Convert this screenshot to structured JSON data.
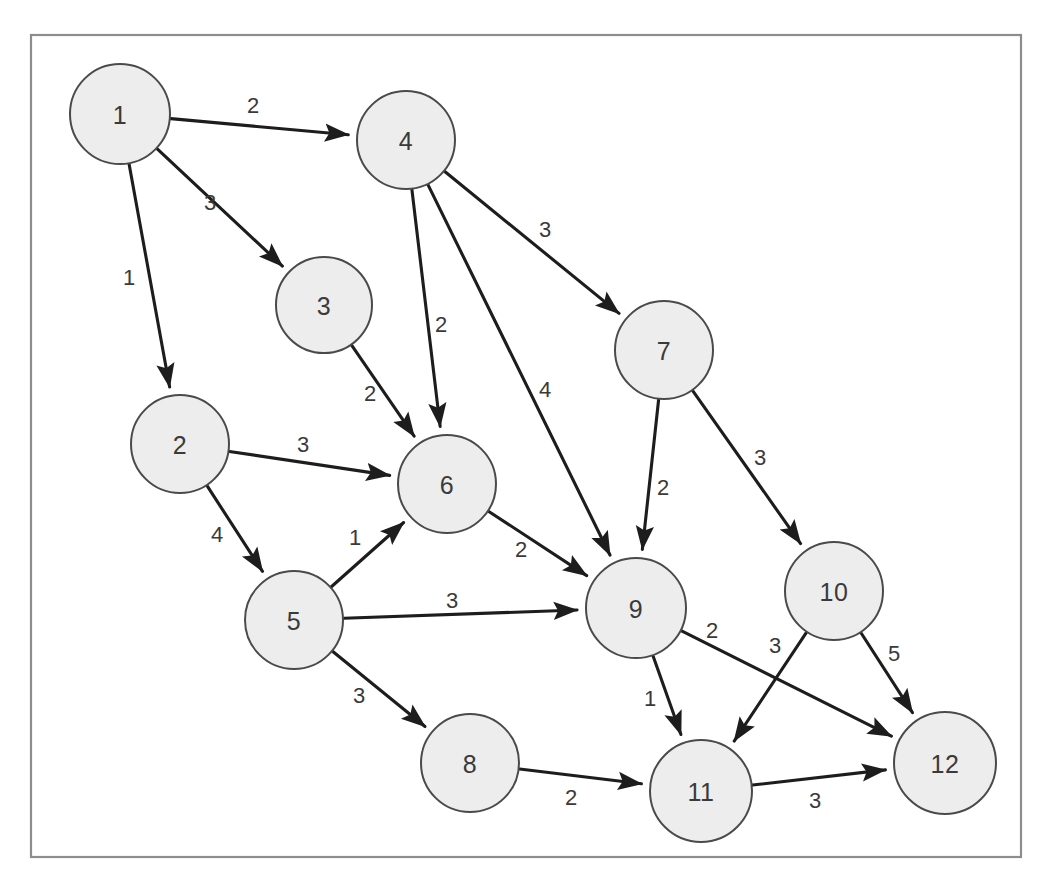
{
  "figure": {
    "kind": "weighted-directed-graph",
    "width": 1052,
    "height": 892,
    "background_color": "#ffffff",
    "frame": {
      "x": 31,
      "y": 35,
      "width": 990,
      "height": 822,
      "stroke_color": "#8d8d8d"
    },
    "node_style": {
      "fill_color": "#ededed",
      "stroke_color": "#4a4a4a",
      "label_color": "#3a3a3a",
      "radius": 49
    },
    "edge_style": {
      "stroke_color": "#1d1d1d",
      "label_color": "#3a3a3a",
      "arrowhead": "filled-triangle"
    }
  },
  "chart_data": {
    "type": "diagram",
    "title": "",
    "directed": true,
    "weighted": true,
    "node_count": 12,
    "edge_count": 18,
    "nodes": [
      {
        "id": 1,
        "label": "1",
        "x": 120,
        "y": 114,
        "r": 50
      },
      {
        "id": 2,
        "label": "2",
        "x": 180,
        "y": 444,
        "r": 49
      },
      {
        "id": 3,
        "label": "3",
        "x": 324,
        "y": 305,
        "r": 48
      },
      {
        "id": 4,
        "label": "4",
        "x": 406,
        "y": 140,
        "r": 49
      },
      {
        "id": 5,
        "label": "5",
        "x": 294,
        "y": 620,
        "r": 49
      },
      {
        "id": 6,
        "label": "6",
        "x": 447,
        "y": 484,
        "r": 49
      },
      {
        "id": 7,
        "label": "7",
        "x": 664,
        "y": 350,
        "r": 49
      },
      {
        "id": 8,
        "label": "8",
        "x": 470,
        "y": 763,
        "r": 49
      },
      {
        "id": 9,
        "label": "9",
        "x": 636,
        "y": 608,
        "r": 50
      },
      {
        "id": 10,
        "label": "10",
        "x": 834,
        "y": 591,
        "r": 49
      },
      {
        "id": 11,
        "label": "11",
        "x": 701,
        "y": 791,
        "r": 51
      },
      {
        "id": 12,
        "label": "12",
        "x": 945,
        "y": 763,
        "r": 51
      }
    ],
    "edges": [
      {
        "from": 1,
        "to": 4,
        "weight": 2,
        "label": "2",
        "label_x": 253,
        "label_y": 105
      },
      {
        "from": 1,
        "to": 3,
        "weight": 3,
        "label": "3",
        "label_x": 210,
        "label_y": 202
      },
      {
        "from": 1,
        "to": 2,
        "weight": 1,
        "label": "1",
        "label_x": 129,
        "label_y": 277
      },
      {
        "from": 3,
        "to": 6,
        "weight": 2,
        "label": "2",
        "label_x": 370,
        "label_y": 393
      },
      {
        "from": 4,
        "to": 6,
        "weight": 2,
        "label": "2",
        "label_x": 441,
        "label_y": 324
      },
      {
        "from": 4,
        "to": 7,
        "weight": 3,
        "label": "3",
        "label_x": 545,
        "label_y": 229
      },
      {
        "from": 4,
        "to": 9,
        "weight": 4,
        "label": "4",
        "label_x": 545,
        "label_y": 389
      },
      {
        "from": 2,
        "to": 6,
        "weight": 3,
        "label": "3",
        "label_x": 303,
        "label_y": 444
      },
      {
        "from": 2,
        "to": 5,
        "weight": 4,
        "label": "4",
        "label_x": 217,
        "label_y": 534
      },
      {
        "from": 5,
        "to": 6,
        "weight": 1,
        "label": "1",
        "label_x": 355,
        "label_y": 537
      },
      {
        "from": 5,
        "to": 9,
        "weight": 3,
        "label": "3",
        "label_x": 452,
        "label_y": 600
      },
      {
        "from": 5,
        "to": 8,
        "weight": 3,
        "label": "3",
        "label_x": 359,
        "label_y": 695
      },
      {
        "from": 6,
        "to": 9,
        "weight": 2,
        "label": "2",
        "label_x": 521,
        "label_y": 549
      },
      {
        "from": 7,
        "to": 9,
        "weight": 2,
        "label": "2",
        "label_x": 663,
        "label_y": 487
      },
      {
        "from": 7,
        "to": 10,
        "weight": 3,
        "label": "3",
        "label_x": 760,
        "label_y": 457
      },
      {
        "from": 8,
        "to": 11,
        "weight": 2,
        "label": "2",
        "label_x": 571,
        "label_y": 797
      },
      {
        "from": 9,
        "to": 11,
        "weight": 1,
        "label": "1",
        "label_x": 650,
        "label_y": 698
      },
      {
        "from": 9,
        "to": 12,
        "weight": 2,
        "label": "2",
        "label_x": 712,
        "label_y": 630
      },
      {
        "from": 10,
        "to": 11,
        "weight": 3,
        "label": "3",
        "label_x": 775,
        "label_y": 645
      },
      {
        "from": 10,
        "to": 12,
        "weight": 5,
        "label": "5",
        "label_x": 894,
        "label_y": 653
      },
      {
        "from": 11,
        "to": 12,
        "weight": 3,
        "label": "3",
        "label_x": 815,
        "label_y": 800
      }
    ]
  }
}
